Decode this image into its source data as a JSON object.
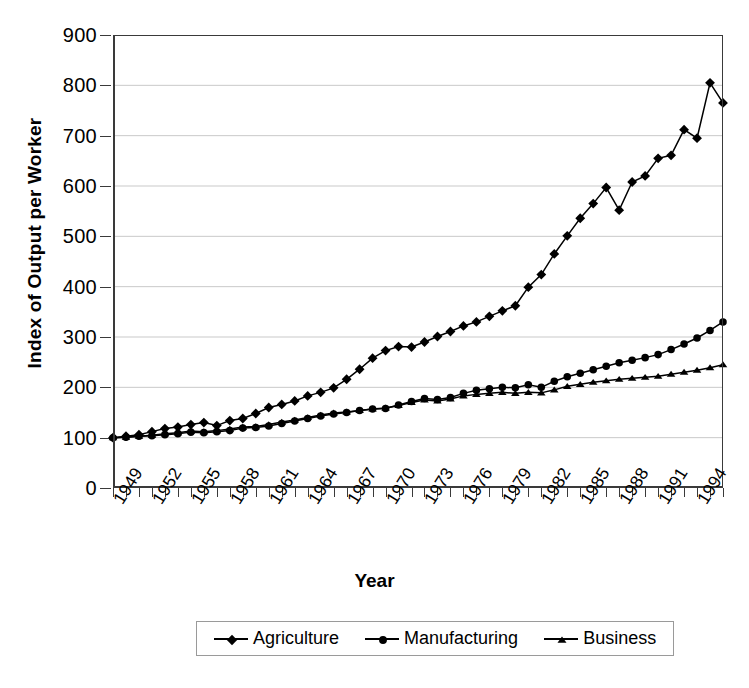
{
  "chart_data": {
    "type": "line",
    "title": "",
    "xlabel": "Year",
    "ylabel": "Index of Output per Worker",
    "xlim": [
      1949,
      1996
    ],
    "ylim": [
      0,
      900
    ],
    "ytick_step": 100,
    "yticks": [
      0,
      100,
      200,
      300,
      400,
      500,
      600,
      700,
      800,
      900
    ],
    "xtick_labels": [
      "1949",
      "1952",
      "1955",
      "1958",
      "1961",
      "1964",
      "1967",
      "1970",
      "1973",
      "1976",
      "1979",
      "1982",
      "1985",
      "1988",
      "1991",
      "1994"
    ],
    "xtick_label_step": 3,
    "grid": "horizontal",
    "legend_position": "bottom",
    "x": [
      1949,
      1950,
      1951,
      1952,
      1953,
      1954,
      1955,
      1956,
      1957,
      1958,
      1959,
      1960,
      1961,
      1962,
      1963,
      1964,
      1965,
      1966,
      1967,
      1968,
      1969,
      1970,
      1971,
      1972,
      1973,
      1974,
      1975,
      1976,
      1977,
      1978,
      1979,
      1980,
      1981,
      1982,
      1983,
      1984,
      1985,
      1986,
      1987,
      1988,
      1989,
      1990,
      1991,
      1992,
      1993,
      1994,
      1995,
      1996
    ],
    "series": [
      {
        "name": "Agriculture",
        "marker": "diamond",
        "color": "#000000",
        "values": [
          100,
          103,
          106,
          112,
          118,
          121,
          126,
          130,
          124,
          134,
          138,
          148,
          160,
          166,
          173,
          183,
          190,
          199,
          216,
          236,
          258,
          273,
          281,
          280,
          290,
          301,
          311,
          322,
          330,
          341,
          352,
          362,
          399,
          424,
          465,
          501,
          536,
          565,
          597,
          552,
          608,
          620,
          655,
          661,
          712,
          695,
          805,
          765
        ]
      },
      {
        "name": "Manufacturing",
        "marker": "circle",
        "color": "#000000",
        "values": [
          100,
          101,
          103,
          104,
          106,
          108,
          111,
          110,
          112,
          114,
          119,
          120,
          123,
          128,
          133,
          138,
          143,
          147,
          150,
          154,
          157,
          158,
          165,
          172,
          178,
          176,
          180,
          188,
          194,
          197,
          200,
          199,
          205,
          200,
          212,
          221,
          228,
          235,
          242,
          249,
          254,
          259,
          265,
          275,
          286,
          298,
          313,
          330
        ]
      },
      {
        "name": "Business",
        "marker": "triangle",
        "color": "#000000",
        "values": [
          100,
          101,
          103,
          105,
          108,
          110,
          113,
          112,
          114,
          117,
          121,
          122,
          126,
          131,
          135,
          140,
          145,
          149,
          151,
          154,
          157,
          159,
          164,
          170,
          175,
          173,
          177,
          183,
          186,
          188,
          190,
          188,
          190,
          189,
          195,
          202,
          206,
          210,
          213,
          216,
          218,
          220,
          222,
          226,
          230,
          234,
          239,
          245
        ]
      }
    ]
  },
  "axis": {
    "y_title": "Index of Output per Worker",
    "x_title": "Year"
  },
  "legend": {
    "entries": [
      {
        "label": "Agriculture",
        "marker": "diamond-marker"
      },
      {
        "label": "Manufacturing",
        "marker": "circle-marker"
      },
      {
        "label": "Business",
        "marker": "triangle-marker"
      }
    ]
  }
}
